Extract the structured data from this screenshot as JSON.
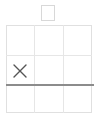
{
  "game": {
    "type": "tic-tac-toe",
    "current_player_box": "",
    "board": [
      [
        "",
        "",
        ""
      ],
      [
        "X",
        "",
        ""
      ],
      [
        "",
        "",
        ""
      ]
    ],
    "marks": {
      "x_icon": "x-mark-icon"
    },
    "colors": {
      "grid_line": "#e6e6e6",
      "highlight_line": "#8c8c8c",
      "mark": "#555555"
    }
  }
}
